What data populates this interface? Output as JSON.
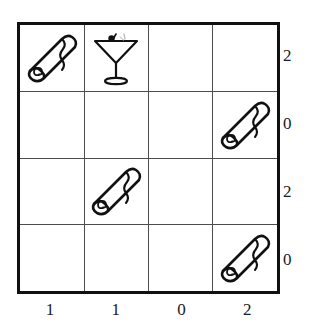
{
  "puzzle": {
    "grid": {
      "rows": 4,
      "columns": 4,
      "border_color": "#111111",
      "line_color": "#4d4d4d",
      "background": "#ffffff"
    },
    "cells": [
      [
        {
          "icon": "towel-icon",
          "label": "rolled towel"
        },
        {
          "icon": "cocktail-icon",
          "label": "martini glass"
        },
        {
          "icon": "",
          "label": ""
        },
        {
          "icon": "",
          "label": ""
        }
      ],
      [
        {
          "icon": "",
          "label": ""
        },
        {
          "icon": "",
          "label": ""
        },
        {
          "icon": "",
          "label": ""
        },
        {
          "icon": "towel-icon",
          "label": "rolled towel"
        }
      ],
      [
        {
          "icon": "",
          "label": ""
        },
        {
          "icon": "towel-icon",
          "label": "rolled towel"
        },
        {
          "icon": "",
          "label": ""
        },
        {
          "icon": "",
          "label": ""
        }
      ],
      [
        {
          "icon": "",
          "label": ""
        },
        {
          "icon": "",
          "label": ""
        },
        {
          "icon": "",
          "label": ""
        },
        {
          "icon": "towel-icon",
          "label": "rolled towel"
        }
      ]
    ],
    "row_clues": [
      "2",
      "0",
      "2",
      "0"
    ],
    "column_clues": [
      "1",
      "1",
      "0",
      "2"
    ]
  }
}
